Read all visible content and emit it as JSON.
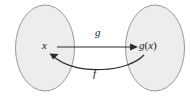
{
  "figure": {
    "background_color": "#ffffff",
    "sets": [
      {
        "name": "domain-set",
        "fill_color": "#ededed",
        "stroke_color": "#9a9a9a",
        "cx": 45,
        "cy": 48,
        "rx": 30,
        "ry": 43
      },
      {
        "name": "codomain-set",
        "fill_color": "#ededed",
        "stroke_color": "#9a9a9a",
        "cx": 155,
        "cy": 48,
        "rx": 30,
        "ry": 43
      }
    ],
    "elements": {
      "domain_element": "x",
      "codomain_element_g": "g",
      "codomain_element_paren_open": "(",
      "codomain_element_var": "x",
      "codomain_element_paren_close": ")"
    },
    "arrows": [
      {
        "name": "forward-arrow",
        "label": "g",
        "direction": "left-to-right",
        "style": "straight",
        "color": "#2a2a2a"
      },
      {
        "name": "inverse-arrow",
        "label": "f",
        "direction": "right-to-left",
        "style": "curved",
        "color": "#2a2a2a"
      }
    ]
  }
}
